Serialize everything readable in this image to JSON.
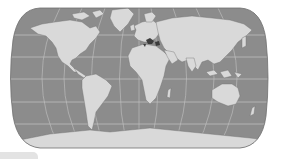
{
  "map": {
    "title": "World map",
    "projection": "Robinson-style pseudocylindrical",
    "style": "grayscale",
    "colors": {
      "ocean": "#8c8c8c",
      "land": "#d9d9d9",
      "border_outline": "#6e6e6e",
      "graticule": "#c4c4c4",
      "highlight_region": "#3c3c3c",
      "background": "#ffffff"
    },
    "graticule": {
      "parallels_y": [
        35,
        57,
        79,
        102,
        124
      ],
      "meridian_count": 12
    },
    "highlighted_region": "Eastern Mediterranean / Balkans",
    "continents": [
      "North America",
      "South America",
      "Europe",
      "Africa",
      "Asia",
      "Australia",
      "Antarctica",
      "Greenland"
    ]
  },
  "footer_tab": {
    "label": ""
  }
}
